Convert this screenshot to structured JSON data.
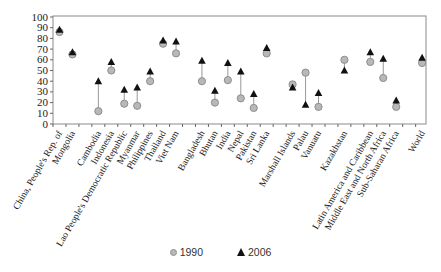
{
  "chart_data": {
    "type": "scatter",
    "title": "",
    "xlabel": "",
    "ylabel": "",
    "ylim": [
      0,
      100
    ],
    "yticks": [
      0,
      10,
      20,
      30,
      40,
      50,
      60,
      70,
      80,
      90,
      100
    ],
    "grid": false,
    "legend_position": "bottom",
    "categories": [
      "China, People's Rep. of",
      "Mongolia",
      "",
      "Cambodia",
      "Indonesia",
      "Lao People's Democratic Republic",
      "Myanmar",
      "Philippines",
      "Thailand",
      "Viet Nam",
      "",
      "Bangladesh",
      "Bhutan",
      "India",
      "Nepal",
      "Pakistan",
      "Sri Lanka",
      "",
      "Marshall Islands",
      "Palau",
      "Vanuatu",
      "",
      "Kazakhstan",
      "",
      "Latin America and Caribbean",
      "Middle East and North Africa",
      "Sub-Saharan Africa",
      "",
      "World"
    ],
    "series": [
      {
        "name": "1990",
        "marker": "circle",
        "color": "#b8b8b8",
        "values": [
          86,
          65,
          null,
          12,
          50,
          19,
          17,
          40,
          75,
          66,
          null,
          40,
          20,
          41,
          24,
          15,
          66,
          null,
          37,
          48,
          16,
          null,
          60,
          null,
          58,
          43,
          16,
          null,
          57
        ]
      },
      {
        "name": "2006",
        "marker": "triangle",
        "color": "#111111",
        "values": [
          88,
          67,
          null,
          40,
          58,
          32,
          34,
          49,
          78,
          77,
          null,
          59,
          31,
          57,
          49,
          28,
          71,
          null,
          34,
          18,
          29,
          null,
          50,
          null,
          67,
          61,
          22,
          null,
          62
        ]
      }
    ]
  },
  "legend": {
    "items": [
      {
        "label": "1990",
        "icon": "circle-marker-icon"
      },
      {
        "label": "2006",
        "icon": "triangle-marker-icon"
      }
    ]
  }
}
